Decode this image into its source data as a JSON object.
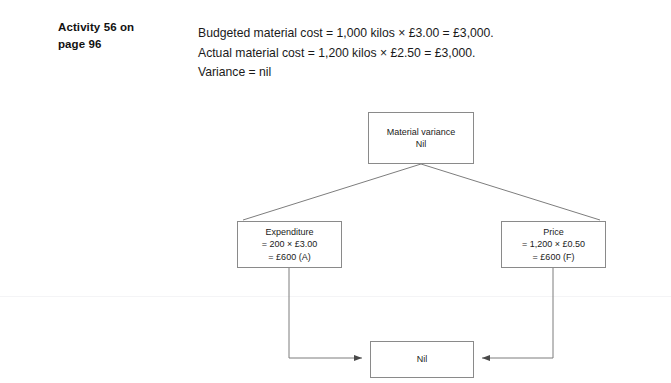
{
  "activity": {
    "heading_line_1": "Activity 56 on",
    "heading_line_2": "page 96"
  },
  "statement": {
    "line_1": "Budgeted material cost = 1,000 kilos × £3.00 = £3,000.",
    "line_2": "Actual material cost = 1,200 kilos × £2.50 = £3,000.",
    "line_3": "Variance = nil"
  },
  "diagram": {
    "type": "variance-tree",
    "nodes": {
      "material_variance": {
        "line_1": "Material variance",
        "line_2": "Nil"
      },
      "expenditure": {
        "line_1": "Expenditure",
        "line_2": "= 200 × £3.00",
        "line_3": "= £600 (A)"
      },
      "price": {
        "line_1": "Price",
        "line_2": "= 1,200 × £0.50",
        "line_3": "= £600 (F)"
      },
      "total": {
        "line_1": "Nil"
      }
    }
  },
  "colors": {
    "box_border": "#8a8a8a",
    "connector": "#7d7d7d",
    "text": "#1a1a1a",
    "page_rule": "#f4f4f6",
    "background": "#ffffff"
  }
}
